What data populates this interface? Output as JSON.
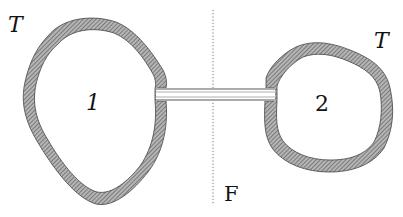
{
  "diagram": {
    "title": "",
    "labels": {
      "tube_left": "T",
      "tube_right": "T",
      "region_1": "1",
      "region_2": "2",
      "divider": "F"
    },
    "elements": [
      {
        "id": "bubble-1",
        "type": "thick-walled closed region",
        "label": "1",
        "wall_label": "T"
      },
      {
        "id": "bubble-2",
        "type": "thick-walled closed region",
        "label": "2",
        "wall_label": "T"
      },
      {
        "id": "connector",
        "type": "thin double-walled tube",
        "connects": [
          "bubble-1",
          "bubble-2"
        ]
      },
      {
        "id": "plane-F",
        "type": "dotted vertical line",
        "label": "F"
      }
    ],
    "colors": {
      "wall_fill": "#8a8a8a",
      "wall_stroke": "#444444",
      "background": "#ffffff",
      "divider": "#777777"
    }
  }
}
